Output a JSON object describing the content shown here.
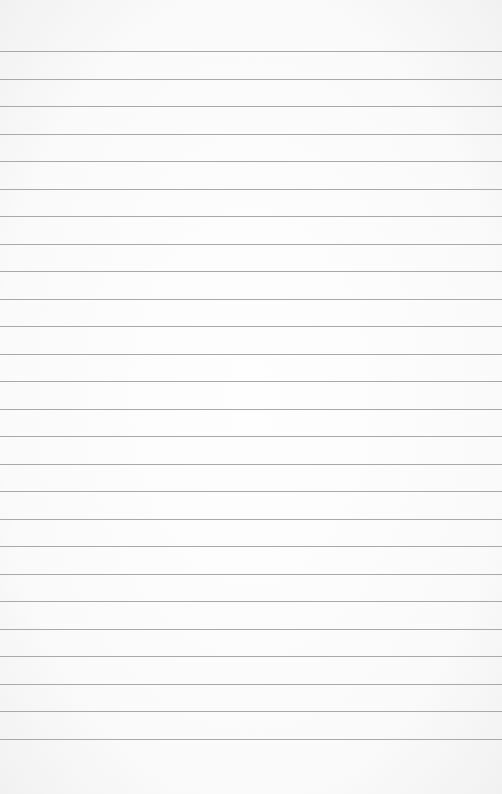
{
  "paper": {
    "type": "ruled-lined-paper",
    "line_count": 26,
    "first_line_y": 51,
    "line_spacing": 27.5,
    "line_color": "#a9a9a9",
    "background_color": "#fbfbfb"
  }
}
